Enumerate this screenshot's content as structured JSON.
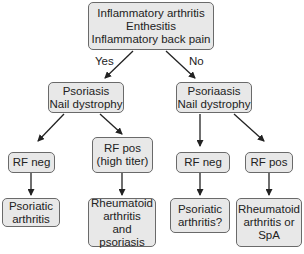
{
  "diagram": {
    "root": {
      "lines": [
        "Inflammatory arthritis",
        "Enthesitis",
        "Inflammatory back pain"
      ]
    },
    "edge_labels": {
      "yes": "Yes",
      "no": "No"
    },
    "left_branch": {
      "node": {
        "lines": [
          "Psoriasis",
          "Nail dystrophy"
        ]
      },
      "rf_neg": {
        "lines": [
          "RF neg"
        ]
      },
      "rf_pos": {
        "lines": [
          "RF pos",
          "(high titer)"
        ]
      },
      "outcome_neg": {
        "lines": [
          "Psoriatic",
          "arthritis"
        ]
      },
      "outcome_pos": {
        "lines": [
          "Rheumatoid",
          "arthritis",
          "and psoriasis"
        ]
      }
    },
    "right_branch": {
      "node": {
        "lines": [
          "Psoriaasis",
          "Nail dystrophy"
        ]
      },
      "rf_neg": {
        "lines": [
          "RF neg"
        ]
      },
      "rf_pos": {
        "lines": [
          "RF pos"
        ]
      },
      "outcome_neg": {
        "lines": [
          "Psoriatic",
          "arthritis?"
        ]
      },
      "outcome_pos": {
        "lines": [
          "Rheumatoid",
          "arthritis or",
          "SpA"
        ]
      }
    }
  }
}
